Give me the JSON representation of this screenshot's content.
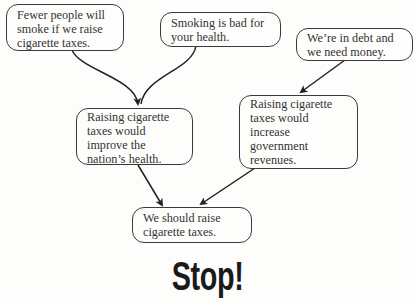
{
  "diagram": {
    "type": "argument-map",
    "nodes": [
      {
        "id": "premise_fewer_smokers",
        "text": "Fewer people will\nsmoke if we raise\ncigarette taxes."
      },
      {
        "id": "premise_bad_health",
        "text": "Smoking is bad for\nyour health."
      },
      {
        "id": "premise_debt",
        "text": "We’re in debt and\nwe need money."
      },
      {
        "id": "sub_health",
        "text": "Raising cigarette\ntaxes would\nimprove the\nnation’s health."
      },
      {
        "id": "sub_revenue",
        "text": "Raising cigarette\ntaxes would\nincrease\ngovernment\nrevenues."
      },
      {
        "id": "conclusion",
        "text": "We should raise\ncigarette taxes."
      }
    ],
    "edges": [
      {
        "from": "premise_fewer_smokers",
        "to": "sub_health"
      },
      {
        "from": "premise_bad_health",
        "to": "sub_health"
      },
      {
        "from": "premise_debt",
        "to": "sub_revenue"
      },
      {
        "from": "sub_health",
        "to": "conclusion"
      },
      {
        "from": "sub_revenue",
        "to": "conclusion"
      }
    ]
  },
  "boxes": {
    "a": "Fewer people will\nsmoke if we raise\ncigarette taxes.",
    "b": "Smoking is bad for\nyour health.",
    "c": "We’re in debt and\nwe need money.",
    "d": "Raising cigarette\ntaxes would\nimprove the\nnation’s health.",
    "e": "Raising cigarette\ntaxes would\nincrease\ngovernment\nrevenues.",
    "f": "We should raise\ncigarette taxes."
  },
  "heading": {
    "stop": "Stop!"
  }
}
